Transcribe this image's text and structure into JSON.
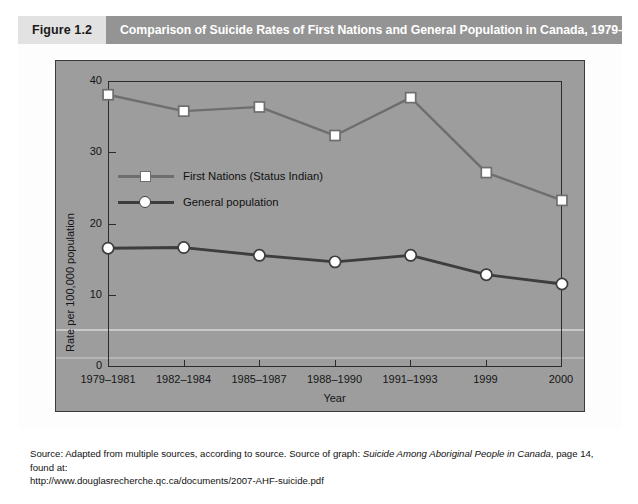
{
  "figure": {
    "number_label": "Figure 1.2",
    "title": "Comparison of Suicide Rates of First Nations and General Population in Canada, 1979–2000"
  },
  "legend": {
    "position": "inside-upper-left",
    "items": [
      {
        "label": "First Nations (Status Indian)",
        "marker": "square",
        "color": "#6e6e6e"
      },
      {
        "label": "General population",
        "marker": "circle",
        "color": "#3d3d3d"
      }
    ]
  },
  "source": {
    "line1_prefix": "Source: Adapted from multiple sources, according to source. Source of graph: ",
    "line1_italic": "Suicide Among Aboriginal People in Canada",
    "line1_suffix": ", page 14, found at:",
    "line2": "http://www.douglasrecherche.qc.ca/documents/2007-AHF-suicide.pdf"
  },
  "colors": {
    "plot_background": "#9d9d9d",
    "panel_background": "#fdfdfd",
    "header_band": "#949494",
    "header_number_box": "#e2e2e2",
    "axis": "#2c2c2c",
    "series_first_nations": "#6e6e6e",
    "series_general": "#3d3d3d",
    "marker_fill": "#ffffff"
  },
  "chart_data": {
    "type": "line",
    "title": "Comparison of Suicide Rates of First Nations and General Population in Canada, 1979–2000",
    "xlabel": "Year",
    "ylabel": "Rate per 100,000 population",
    "categories": [
      "1979–1981",
      "1982–1984",
      "1985–1987",
      "1988–1990",
      "1991–1993",
      "1999",
      "2000"
    ],
    "yticks": [
      0,
      10,
      20,
      30,
      40
    ],
    "ylim": [
      0,
      40
    ],
    "grid": false,
    "legend_position": "inside-upper-left",
    "series": [
      {
        "name": "First Nations (Status Indian)",
        "marker": "square",
        "color": "#6e6e6e",
        "values": [
          38.1,
          35.8,
          36.4,
          32.4,
          37.7,
          27.2,
          23.3
        ]
      },
      {
        "name": "General population",
        "marker": "circle",
        "color": "#3d3d3d",
        "values": [
          16.6,
          16.7,
          15.6,
          14.7,
          15.6,
          12.9,
          11.6
        ]
      }
    ]
  }
}
